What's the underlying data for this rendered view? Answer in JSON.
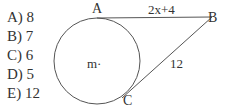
{
  "choices": [
    {
      "label": "A)",
      "value": "8"
    },
    {
      "label": "B)",
      "value": "7"
    },
    {
      "label": "C)",
      "value": "6"
    },
    {
      "label": "D)",
      "value": "5"
    },
    {
      "label": "E)",
      "value": "12"
    }
  ],
  "diagram": {
    "points": {
      "A": "A",
      "B": "B",
      "C": "C"
    },
    "center_label": "m·",
    "segment_AB_label": "2x+4",
    "segment_BC_label": "12",
    "line_color": "#555555"
  }
}
